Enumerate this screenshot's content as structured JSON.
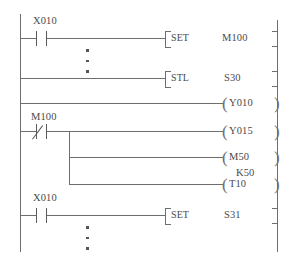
{
  "diagram": {
    "type": "ladder-logic",
    "standard": "Mitsubishi FX STL",
    "left_rail": "power-rail-left",
    "right_rail": "power-rail-right"
  },
  "rungs": [
    {
      "id": "rung-1",
      "contact": {
        "device": "X010",
        "type": "normally-open"
      },
      "instruction": {
        "mnemonic": "SET",
        "operand": "M100"
      },
      "terminator": "]"
    },
    {
      "id": "rung-2",
      "contact": null,
      "instruction": {
        "mnemonic": "STL",
        "operand": "S30"
      },
      "terminator": "]"
    },
    {
      "id": "rung-3",
      "contact": null,
      "coil": {
        "device": "Y010",
        "type": "output"
      },
      "terminator": ")"
    },
    {
      "id": "rung-4",
      "contact": {
        "device": "M100",
        "type": "normally-closed"
      },
      "branch_outputs": [
        {
          "device": "Y015",
          "type": "output",
          "preset": null
        },
        {
          "device": "M50",
          "type": "output",
          "preset": null
        },
        {
          "device": "T10",
          "type": "timer",
          "preset": "K50"
        }
      ]
    },
    {
      "id": "rung-5",
      "contact": {
        "device": "X010",
        "type": "normally-open"
      },
      "instruction": {
        "mnemonic": "SET",
        "operand": "S31"
      },
      "terminator": "]"
    }
  ],
  "labels": {
    "x010_first": "X010",
    "x010_last": "X010",
    "m100_contact": "M100",
    "set_1": "SET",
    "m100_operand": "M100",
    "stl": "STL",
    "s30": "S30",
    "y010": "Y010",
    "y015": "Y015",
    "m50": "M50",
    "k50": "K50",
    "t10": "T10",
    "set_2": "SET",
    "s31": "S31",
    "bracket_open": "[",
    "bracket_close": "]",
    "coil_open_paren": "(",
    "coil_close_paren": ")"
  },
  "colors": {
    "line": "#6e6e6e",
    "text": "#4a4a4a",
    "background": "#ffffff"
  },
  "ellipsis": {
    "upper": "vertical-ellipsis-after-rung-1",
    "lower": "vertical-ellipsis-after-rung-5",
    "dot_count": 3
  }
}
